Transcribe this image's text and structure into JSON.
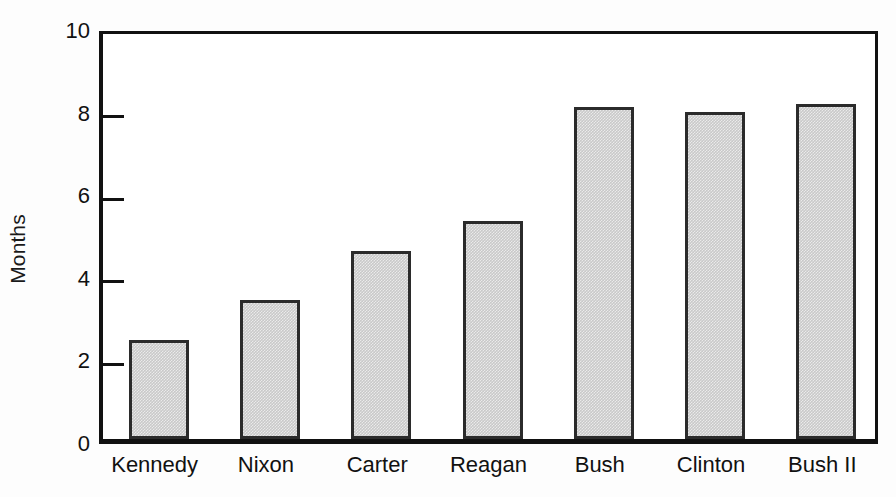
{
  "chart_data": {
    "type": "bar",
    "title": "",
    "xlabel": "",
    "ylabel": "Months",
    "categories": [
      "Kennedy",
      "Nixon",
      "Carter",
      "Reagan",
      "Bush",
      "Clinton",
      "Bush II"
    ],
    "values": [
      2.4,
      3.37,
      4.55,
      5.28,
      8.05,
      7.93,
      8.1
    ],
    "ylim": [
      0,
      10
    ],
    "yticks": [
      0,
      2,
      4,
      6,
      8,
      10
    ],
    "ytick_labels": [
      "0",
      "2",
      "4",
      "6",
      "8",
      "10"
    ],
    "grid": false,
    "legend": null,
    "bar_fill_color": "#c9c9c9",
    "bar_edge_color": "#2b2b2b",
    "axis_color": "#111111",
    "background_color": "#fdfdfd"
  }
}
